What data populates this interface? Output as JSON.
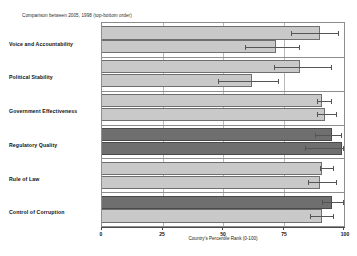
{
  "chart_data": {
    "type": "bar",
    "orientation": "horizontal",
    "title": "",
    "subtitle": "Comparison between 2005, 1998 (top-bottom order)",
    "xlabel": "Country's Percentile Rank (0-100)",
    "ylabel": "",
    "xlim": [
      0,
      100
    ],
    "xticks": [
      0,
      25,
      50,
      75,
      100
    ],
    "xticklabels": [
      "0",
      "25",
      "50",
      "75",
      "100"
    ],
    "grid": "vertical",
    "legend": "none",
    "categories": [
      "Voice and Accountability",
      "Political Stability",
      "Government Effectiveness",
      "Regulatory Quality",
      "Rule of Law",
      "Control of Corruption"
    ],
    "series": [
      {
        "name": "2005",
        "position": "top",
        "values": [
          90,
          82,
          91,
          95,
          91,
          95
        ],
        "err_low": [
          78,
          71,
          89,
          88,
          90,
          91
        ],
        "err_high": [
          98,
          95,
          95,
          99,
          96,
          100
        ],
        "colors": [
          "#c9c9c9",
          "#c9c9c9",
          "#c9c9c9",
          "#6f6f6f",
          "#c9c9c9",
          "#6f6f6f"
        ]
      },
      {
        "name": "1998",
        "position": "bottom",
        "values": [
          72,
          62,
          92,
          99,
          90,
          91
        ],
        "err_low": [
          59,
          48,
          89,
          84,
          85,
          86
        ],
        "err_high": [
          82,
          73,
          97,
          100,
          97,
          96
        ],
        "colors": [
          "#c9c9c9",
          "#c9c9c9",
          "#c9c9c9",
          "#6f6f6f",
          "#c9c9c9",
          "#c9c9c9"
        ]
      }
    ]
  },
  "axis": {
    "x_title": "Country's Percentile Rank (0-100)",
    "tick_0": "0",
    "tick_25": "25",
    "tick_50": "50",
    "tick_75": "75",
    "tick_100": "100"
  },
  "labels": {
    "subtitle": "Comparison between 2005, 1998 (top-bottom order)",
    "cat_0": "Voice and Accountability",
    "cat_1": "Political Stability",
    "cat_2": "Government Effectiveness",
    "cat_3": "Regulatory Quality",
    "cat_4": "Rule of Law",
    "cat_5": "Control of Corruption"
  }
}
